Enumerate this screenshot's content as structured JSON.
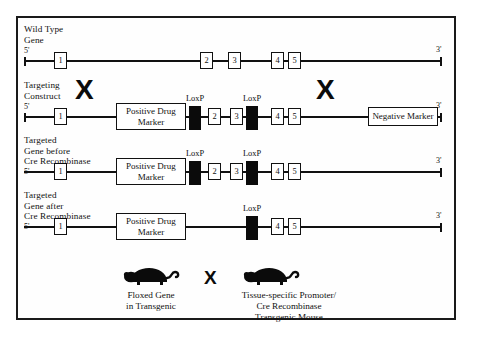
{
  "figure": {
    "title_visible": false,
    "frame_color": "#1a1a1a",
    "background": "#ffffff",
    "ink": "#111111",
    "loxp_fill": "#0b0b0b"
  },
  "rows": [
    {
      "id": "wild-type",
      "label": "Wild Type\nGene",
      "five_prime": "5'",
      "three_prime": "3'",
      "exons": [
        "1",
        "2",
        "3",
        "4",
        "5"
      ],
      "loxp_labels": [],
      "markers": []
    },
    {
      "id": "targeting-construct",
      "label": "Targeting\nConstruct",
      "five_prime": "5'",
      "three_prime": "3'",
      "exons": [
        "1",
        "2",
        "3",
        "4",
        "5"
      ],
      "loxp_labels": [
        "LoxP",
        "LoxP"
      ],
      "markers": [
        "Positive Drug\nMarker",
        "Negative Marker"
      ]
    },
    {
      "id": "targeted-gene-before-cre",
      "label": "Targeted\nGene before\nCre Recombinase",
      "five_prime": "5'",
      "three_prime": "3'",
      "exons": [
        "1",
        "2",
        "3",
        "4",
        "5"
      ],
      "loxp_labels": [
        "LoxP",
        "LoxP"
      ],
      "markers": [
        "Positive Drug\nMarker"
      ]
    },
    {
      "id": "targeted-gene-after-cre",
      "label": "Targeted\nGene after\nCre Recombinase",
      "five_prime": "5'",
      "three_prime": "3'",
      "exons": [
        "1",
        "4",
        "5"
      ],
      "loxp_labels": [
        "LoxP"
      ],
      "markers": [
        "Positive Drug\nMarker"
      ]
    }
  ],
  "crosses": {
    "row2_left": "X",
    "row2_right": "X",
    "mating": "X"
  },
  "mating": {
    "left": {
      "icon": "mouse-icon",
      "caption": "Floxed Gene\nin Transgenic"
    },
    "right": {
      "icon": "mouse-icon",
      "caption": "Tissue-specific Promoter/\nCre Recombinase\nTransgenic Mouse"
    }
  }
}
